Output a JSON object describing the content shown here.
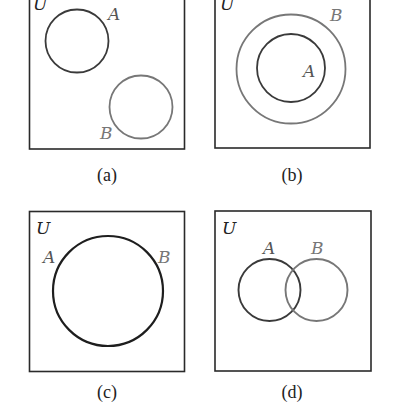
{
  "colors": {
    "box": "#2a2a2a",
    "dark_circle": "#3a3a3a",
    "light_circle": "#777777",
    "universe_label": "#222222",
    "set_label_dark": "#555555",
    "set_label_light": "#777777"
  },
  "panels": [
    {
      "id": "a",
      "caption": "(a)",
      "universe_label": "U",
      "description": "Disjoint sets A and B",
      "sets": [
        {
          "label": "A",
          "shade": "dark"
        },
        {
          "label": "B",
          "shade": "light"
        }
      ]
    },
    {
      "id": "b",
      "caption": "(b)",
      "universe_label": "U",
      "description": "A is a subset of B",
      "sets": [
        {
          "label": "B",
          "shade": "light"
        },
        {
          "label": "A",
          "shade": "dark"
        }
      ]
    },
    {
      "id": "c",
      "caption": "(c)",
      "universe_label": "U",
      "description": "A equals B",
      "sets": [
        {
          "label": "A",
          "shade": "dark"
        },
        {
          "label": "B",
          "shade": "light"
        }
      ]
    },
    {
      "id": "d",
      "caption": "(d)",
      "universe_label": "U",
      "description": "A and B overlap",
      "sets": [
        {
          "label": "A",
          "shade": "dark"
        },
        {
          "label": "B",
          "shade": "light"
        }
      ]
    }
  ]
}
